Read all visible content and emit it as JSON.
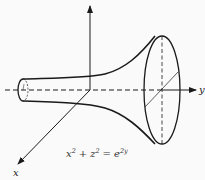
{
  "figure": {
    "type": "3d-surface-diagram",
    "surface": "horn-shaped surface of revolution about the y-axis",
    "axes": {
      "x_label": "x",
      "y_label": "y",
      "z_label": ""
    },
    "equation": {
      "lhs_x": "x",
      "lhs_x_exp": "2",
      "plus": "+",
      "lhs_z": "z",
      "lhs_z_exp": "2",
      "equals": "=",
      "rhs_base": "e",
      "rhs_exp": "2y",
      "full_text": "x² + z² = e²ʸ"
    },
    "colors": {
      "background": "#fafafa",
      "stroke": "#1a1a1a",
      "text": "#333333"
    }
  }
}
